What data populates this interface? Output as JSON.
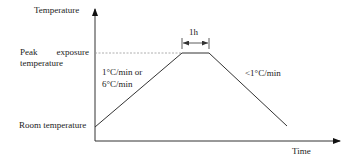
{
  "diagram": {
    "y_axis_label": "Temperature",
    "x_axis_label": "Time",
    "levels": {
      "peak_line1": "Peak   exposure",
      "peak_line2": "temperature",
      "room": "Room temperature"
    },
    "segments": {
      "heating_rate_line1": "1°C/min or",
      "heating_rate_line2": "6°C/min",
      "hold_duration": "1h",
      "cooling_rate": "<1°C/min"
    },
    "colors": {
      "line": "#333333",
      "dashed": "#999999",
      "text": "#222222"
    }
  }
}
